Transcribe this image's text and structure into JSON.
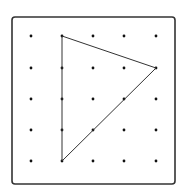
{
  "diagram": {
    "type": "geoboard",
    "grid": {
      "columns": 5,
      "rows": 5,
      "x_positions": [
        31,
        62,
        93,
        124,
        156
      ],
      "y_positions": [
        36,
        68,
        99,
        130,
        161
      ],
      "dot_color": "#111111"
    },
    "board": {
      "x": 12,
      "y": 17,
      "width": 163,
      "height": 167,
      "corner_radius": 3,
      "stroke": "#333333"
    },
    "shape": {
      "kind": "triangle",
      "vertices_grid": [
        [
          1,
          0
        ],
        [
          4,
          1
        ],
        [
          1,
          4
        ]
      ],
      "stroke": "#333333"
    }
  }
}
